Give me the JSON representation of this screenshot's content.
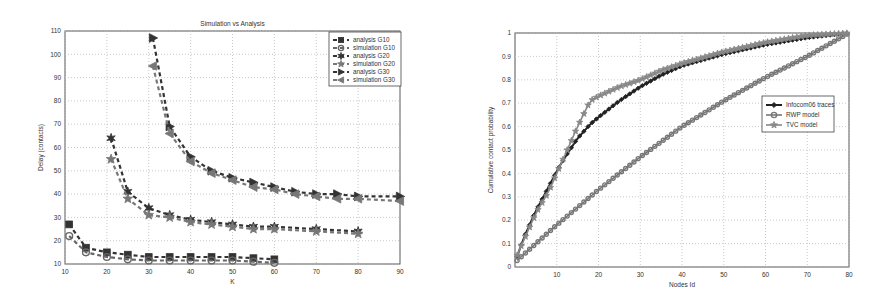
{
  "chart_data": [
    {
      "type": "line",
      "title": "Simulation vs Analysis",
      "xlabel": "K",
      "ylabel": "Delay (contacts)",
      "xlim": [
        10,
        90
      ],
      "ylim": [
        10,
        110
      ],
      "xticks": [
        10,
        20,
        30,
        40,
        50,
        60,
        70,
        80,
        90
      ],
      "yticks": [
        10,
        20,
        30,
        40,
        50,
        60,
        70,
        80,
        90,
        100,
        110
      ],
      "grid": true,
      "legend_position": "top-right",
      "series": [
        {
          "name": "analysis G10",
          "marker": "square",
          "x": [
            11,
            15,
            20,
            25,
            30,
            35,
            40,
            45,
            50,
            55,
            60
          ],
          "values": [
            27,
            17,
            15,
            14,
            13,
            13,
            13,
            13,
            13,
            12.5,
            12
          ]
        },
        {
          "name": "simulation G10",
          "marker": "circle",
          "x": [
            11,
            15,
            20,
            25,
            30,
            35,
            40,
            45,
            50,
            55,
            60
          ],
          "values": [
            22,
            15,
            13,
            12,
            11.5,
            11.5,
            11.5,
            11.5,
            11.5,
            11,
            10.5
          ]
        },
        {
          "name": "analysis G20",
          "marker": "hexagram",
          "x": [
            21,
            25,
            30,
            35,
            40,
            45,
            50,
            55,
            60,
            70,
            80
          ],
          "values": [
            64,
            41,
            34,
            31,
            29,
            28,
            27,
            26,
            26,
            25,
            24
          ]
        },
        {
          "name": "simulation G20",
          "marker": "pentagram",
          "x": [
            21,
            25,
            30,
            35,
            40,
            45,
            50,
            55,
            60,
            70,
            80
          ],
          "values": [
            55,
            38,
            31,
            30,
            28,
            27,
            26,
            25,
            25,
            24,
            23
          ]
        },
        {
          "name": "analysis G30",
          "marker": "triangle-right",
          "x": [
            31,
            35,
            40,
            45,
            50,
            55,
            60,
            65,
            70,
            75,
            80,
            90
          ],
          "values": [
            107,
            69,
            56,
            50,
            47,
            45,
            43,
            41,
            40,
            40,
            39,
            39
          ]
        },
        {
          "name": "simulation G30",
          "marker": "triangle-left",
          "x": [
            31,
            35,
            40,
            45,
            50,
            55,
            60,
            65,
            70,
            75,
            80,
            90
          ],
          "values": [
            95,
            66,
            54,
            49,
            46,
            43,
            42,
            40,
            39,
            38,
            38,
            37
          ]
        }
      ]
    },
    {
      "type": "line",
      "title": "",
      "xlabel": "Nodes Id",
      "ylabel": "Cumulative contact probability",
      "xlim": [
        0,
        80
      ],
      "ylim": [
        0,
        1
      ],
      "xticks": [
        10,
        20,
        30,
        40,
        50,
        60,
        70,
        80
      ],
      "yticks": [
        0,
        0.1,
        0.2,
        0.3,
        0.4,
        0.5,
        0.6,
        0.7,
        0.8,
        0.9,
        1
      ],
      "grid": true,
      "legend_position": "center-right",
      "series": [
        {
          "name": "Infocom06 traces",
          "marker": "diamond",
          "x": [
            0,
            2,
            5,
            8,
            10,
            12,
            15,
            18,
            20,
            25,
            30,
            35,
            40,
            50,
            60,
            70,
            80
          ],
          "values": [
            0.02,
            0.12,
            0.24,
            0.34,
            0.41,
            0.47,
            0.55,
            0.61,
            0.64,
            0.71,
            0.77,
            0.82,
            0.86,
            0.91,
            0.95,
            0.98,
            1.0
          ]
        },
        {
          "name": "RWP model",
          "marker": "circle",
          "x": [
            0,
            5,
            10,
            20,
            30,
            40,
            50,
            60,
            70,
            80
          ],
          "values": [
            0.02,
            0.1,
            0.18,
            0.33,
            0.47,
            0.6,
            0.71,
            0.81,
            0.9,
            1.0
          ]
        },
        {
          "name": "TVC model",
          "marker": "star",
          "x": [
            0,
            2,
            5,
            8,
            10,
            12,
            15,
            18,
            20,
            25,
            30,
            35,
            40,
            50,
            60,
            70,
            80
          ],
          "values": [
            0.03,
            0.11,
            0.23,
            0.32,
            0.4,
            0.48,
            0.6,
            0.71,
            0.73,
            0.77,
            0.8,
            0.84,
            0.87,
            0.92,
            0.96,
            0.99,
            1.0
          ]
        }
      ]
    }
  ],
  "left": {
    "title": "Simulation vs Analysis",
    "xlabel": "K",
    "ylabel": "Delay (contacts)",
    "legend": [
      "analysis G10",
      "simulation G10",
      "analysis G20",
      "simulation G20",
      "analysis G30",
      "simulation G30"
    ]
  },
  "right": {
    "xlabel": "Nodes Id",
    "ylabel": "Cumulative contact probability",
    "legend": [
      "Infocom06 traces",
      "RWP model",
      "TVC model"
    ]
  }
}
